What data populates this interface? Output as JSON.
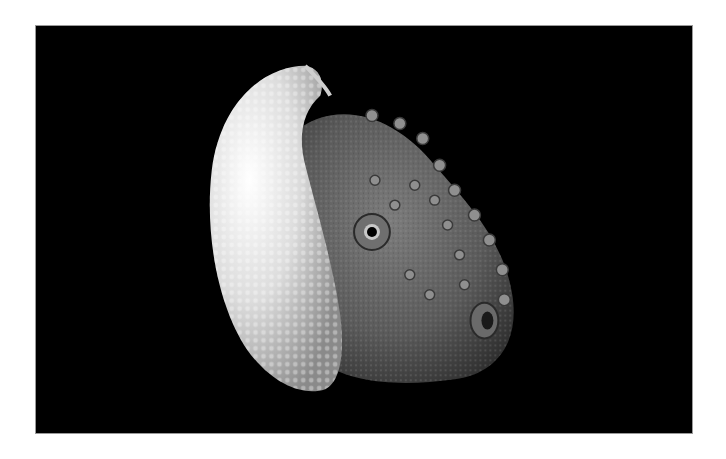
{
  "image": {
    "subject": "Paper nautilus (argonaut) with white ribbed shell and textured octopus body on black background",
    "background_color": "#000000",
    "shell_color": "#e8e8e8",
    "body_color": "#6a6a6a",
    "frame_color": "#ffffff"
  }
}
